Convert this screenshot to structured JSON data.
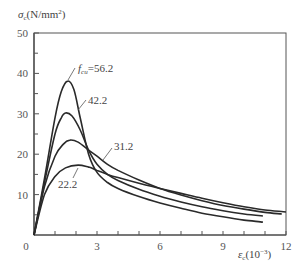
{
  "chart_data": {
    "type": "line",
    "title": "",
    "xlabel": "ε_c (10^-3)",
    "ylabel": "σ_c (N/mm²)",
    "xlim": [
      0,
      12
    ],
    "ylim": [
      0,
      50
    ],
    "x_ticks": [
      0,
      3,
      6,
      9,
      12
    ],
    "y_ticks": [
      10,
      20,
      30,
      40,
      50
    ],
    "origin_label": "0",
    "grid": false,
    "legend": "inline labels",
    "series": [
      {
        "name": "f_cu=56.2",
        "label": "=56.2",
        "label_prefix": "f",
        "label_sub": "cu",
        "x": [
          0,
          0.5,
          1.0,
          1.3,
          1.6,
          1.9,
          2.2,
          2.6,
          3.0,
          3.5,
          4.0,
          5.0,
          6.0,
          7.0,
          8.0,
          9.0,
          10.0,
          10.9
        ],
        "y": [
          0,
          14,
          29,
          35.5,
          38.1,
          36,
          29,
          20,
          15.5,
          13,
          11.5,
          9.5,
          7.9,
          6.6,
          5.4,
          4.5,
          3.7,
          3.2
        ]
      },
      {
        "name": "f_cu=42.2",
        "label": "42.2",
        "x": [
          0,
          0.5,
          1.0,
          1.3,
          1.5,
          1.8,
          2.2,
          2.6,
          3.0,
          3.5,
          4.0,
          5.0,
          6.0,
          7.0,
          8.0,
          9.0,
          10.0,
          10.9
        ],
        "y": [
          0,
          13,
          25,
          29,
          30.2,
          29.5,
          26,
          21,
          17.5,
          15,
          13.5,
          11.3,
          9.6,
          8.2,
          7.0,
          6.0,
          5.2,
          4.7
        ]
      },
      {
        "name": "f_cu=31.2",
        "label": "31.2",
        "x": [
          0,
          0.5,
          1.0,
          1.4,
          1.7,
          2.1,
          2.6,
          3.0,
          3.5,
          4.0,
          5.0,
          6.0,
          7.0,
          8.0,
          9.0,
          10.0,
          11.0,
          11.8
        ],
        "y": [
          0,
          12,
          19.5,
          22.5,
          23.5,
          23,
          21,
          19.5,
          17.5,
          16,
          13.6,
          11.5,
          9.9,
          8.5,
          7.3,
          6.4,
          5.6,
          5.2
        ]
      },
      {
        "name": "f_cu=22.2",
        "label": "22.2",
        "x": [
          0,
          0.5,
          1.0,
          1.5,
          2.1,
          2.6,
          3.0,
          3.5,
          4.0,
          5.0,
          6.0,
          7.0,
          8.0,
          9.0,
          10.0,
          11.0,
          12.0
        ],
        "y": [
          0,
          10,
          14.5,
          16.6,
          17.3,
          16.8,
          16,
          15,
          14.2,
          12.8,
          11.5,
          10.3,
          9.1,
          8.0,
          7.0,
          6.2,
          5.7
        ]
      }
    ]
  }
}
